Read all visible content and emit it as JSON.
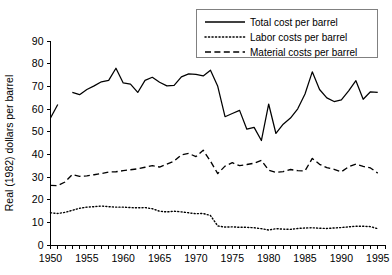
{
  "chart_data": {
    "type": "line",
    "title": "",
    "xlabel": "",
    "ylabel": "Real (1982) dollars per barrel",
    "xlim": [
      1950,
      1996
    ],
    "ylim": [
      0,
      90
    ],
    "ytick_step": 10,
    "xtick_step": 1,
    "xlabel_step": 5,
    "grid": false,
    "legend_position": "top-right",
    "xticklabels": [
      "1950",
      "1955",
      "1960",
      "1965",
      "1970",
      "1975",
      "1980",
      "1985",
      "1990",
      "1995"
    ],
    "yticklabels": [
      "0",
      "10",
      "20",
      "30",
      "40",
      "50",
      "60",
      "70",
      "80",
      "90"
    ],
    "line_color": "#000000",
    "series": [
      {
        "name": "Total cost per barrel",
        "style": "solid",
        "segments": [
          {
            "x": [
              1950,
              1951
            ],
            "values": [
              56.0,
              62.0
            ]
          },
          {
            "x": [
              1953,
              1954,
              1955,
              1956,
              1957,
              1958,
              1959,
              1960,
              1961,
              1962,
              1963,
              1964,
              1965,
              1966,
              1967,
              1968,
              1969,
              1970,
              1971,
              1972,
              1973,
              1974,
              1975,
              1976,
              1977,
              1978,
              1979,
              1980,
              1981,
              1982,
              1983,
              1984,
              1985,
              1986,
              1987,
              1988,
              1989,
              1990,
              1991,
              1992,
              1993,
              1994,
              1995
            ],
            "values": [
              67.3,
              66.3,
              68.6,
              70.2,
              72.0,
              72.6,
              78.0,
              71.5,
              71.0,
              67.3,
              72.6,
              74.0,
              71.8,
              70.2,
              70.4,
              74.2,
              75.5,
              75.3,
              74.6,
              77.1,
              70.0,
              56.6,
              58.0,
              59.4,
              51.1,
              51.9,
              46.1,
              62.2,
              49.2,
              53.3,
              56.0,
              60.1,
              66.6,
              76.4,
              68.6,
              64.9,
              63.3,
              64.0,
              68.0,
              72.5,
              64.3,
              67.6,
              67.3
            ]
          }
        ]
      },
      {
        "name": "Labor costs per barrel",
        "style": "dotted",
        "segments": [
          {
            "x": [
              1950,
              1951,
              1952,
              1953,
              1954,
              1955,
              1956,
              1957,
              1958,
              1959,
              1960,
              1961,
              1962,
              1963,
              1964,
              1965,
              1966,
              1967,
              1968,
              1969,
              1970,
              1971,
              1972,
              1973,
              1974,
              1975,
              1976,
              1977,
              1978,
              1979,
              1980,
              1981,
              1982,
              1983,
              1984,
              1985,
              1986,
              1987,
              1988,
              1989,
              1990,
              1991,
              1992,
              1993,
              1994,
              1995
            ],
            "values": [
              14.2,
              13.9,
              14.4,
              15.3,
              16.2,
              16.7,
              16.9,
              17.2,
              16.9,
              16.7,
              16.7,
              16.5,
              16.4,
              16.5,
              16.0,
              14.9,
              14.6,
              14.9,
              14.6,
              14.2,
              13.8,
              13.9,
              13.0,
              8.4,
              7.9,
              8.0,
              7.8,
              7.8,
              7.6,
              7.2,
              6.6,
              7.2,
              7.0,
              6.9,
              7.3,
              7.5,
              7.6,
              7.4,
              7.3,
              7.5,
              7.7,
              8.0,
              8.3,
              8.3,
              8.1,
              7.2
            ]
          }
        ]
      },
      {
        "name": "Material costs per barrel",
        "style": "dashed",
        "segments": [
          {
            "x": [
              1950,
              1951,
              1952,
              1953,
              1954,
              1955,
              1956,
              1957,
              1958,
              1959,
              1960,
              1961,
              1962,
              1963,
              1964,
              1965,
              1966,
              1967,
              1968,
              1969,
              1970,
              1971,
              1972,
              1973,
              1974,
              1975,
              1976,
              1977,
              1978,
              1979,
              1980,
              1981,
              1982,
              1983,
              1984,
              1985,
              1986,
              1987,
              1988,
              1989,
              1990,
              1991,
              1992,
              1993,
              1994,
              1995
            ],
            "values": [
              26.3,
              26.2,
              27.8,
              31.1,
              30.3,
              30.5,
              31.0,
              31.5,
              32.2,
              32.3,
              32.8,
              33.2,
              33.6,
              34.3,
              35.0,
              34.4,
              35.7,
              37.0,
              39.8,
              40.4,
              39.0,
              41.8,
              37.0,
              31.5,
              34.8,
              36.3,
              35.0,
              35.5,
              36.1,
              37.3,
              33.0,
              32.0,
              32.4,
              33.3,
              32.8,
              32.7,
              38.2,
              35.6,
              34.1,
              33.4,
              32.3,
              34.5,
              35.7,
              34.7,
              34.0,
              31.7
            ]
          }
        ]
      }
    ]
  },
  "legend": {
    "entries": [
      {
        "label": "Total cost per barrel",
        "style": "solid"
      },
      {
        "label": "Labor costs per barrel",
        "style": "dotted"
      },
      {
        "label": "Material costs per barrel",
        "style": "dashed"
      }
    ]
  }
}
